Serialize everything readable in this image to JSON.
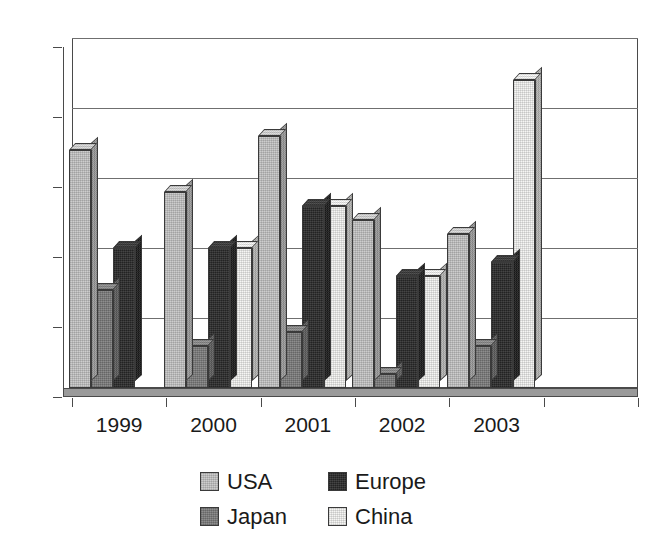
{
  "chart_data": {
    "type": "bar",
    "title": "",
    "subtitle": "",
    "xlabel": "",
    "ylabel": "",
    "categories": [
      "1999",
      "2000",
      "2001",
      "2002",
      "2003",
      ""
    ],
    "series": [
      {
        "name": "USA",
        "color": "#c6c6c6",
        "values": [
          17,
          14,
          18,
          12,
          11,
          0
        ]
      },
      {
        "name": "Japan",
        "color": "#7d7d7d",
        "values": [
          7,
          3,
          4,
          1,
          3,
          0
        ]
      },
      {
        "name": "Europe",
        "color": "#2b2b2b",
        "values": [
          10,
          10,
          13,
          8,
          9,
          0
        ]
      },
      {
        "name": "China",
        "color": "#f4f4f2",
        "values": [
          0,
          10,
          13,
          8,
          22,
          0
        ]
      }
    ],
    "ylim": [
      0,
      25
    ],
    "ytick_values": [
      0,
      5,
      10,
      15,
      20,
      25
    ],
    "ytick_labels": [
      "0",
      "5",
      "10",
      "15",
      "20",
      "25"
    ],
    "grid": true,
    "grid_axis": "y",
    "legend_position": "bottom",
    "style": "3d-column",
    "annotations": []
  },
  "legend": {
    "rows": [
      [
        {
          "label": "USA",
          "swatch": "#c6c6c6"
        },
        {
          "label": "Europe",
          "swatch": "#2b2b2b"
        }
      ],
      [
        {
          "label": "Japan",
          "swatch": "#7d7d7d"
        },
        {
          "label": "China",
          "swatch": "#f4f4f2"
        }
      ]
    ]
  },
  "colors": {
    "background": "#ffffff",
    "axis": "#4a4a4a",
    "gridline": "#6f6f6f",
    "floor": "#9a9a9a",
    "text": "#1a1a1a"
  }
}
